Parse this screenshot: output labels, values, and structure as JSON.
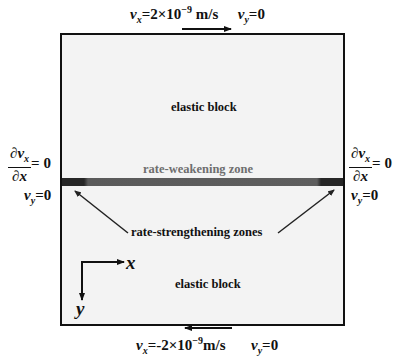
{
  "top_boundary": {
    "vx_label": "v",
    "vx_sub": "x",
    "vx_value": "=2×10",
    "vx_exp": "−9",
    "vx_unit": " m/s",
    "vy_label": "v",
    "vy_sub": "y",
    "vy_value": "=0",
    "arrow_direction": "right"
  },
  "bottom_boundary": {
    "vx_label": "v",
    "vx_sub": "x",
    "vx_value": "=-2×10",
    "vx_exp": "−9",
    "vx_unit": "m/s",
    "vy_label": "v",
    "vy_sub": "y",
    "vy_value": "=0",
    "arrow_direction": "left"
  },
  "left_boundary": {
    "deriv_num": "∂v",
    "deriv_num_sub": "x",
    "deriv_den": "∂x",
    "deriv_value": "= 0",
    "vy_label": "v",
    "vy_sub": "y",
    "vy_value": "=0"
  },
  "right_boundary": {
    "deriv_num": "∂v",
    "deriv_num_sub": "x",
    "deriv_den": "∂x",
    "deriv_value": "= 0",
    "vy_label": "v",
    "vy_sub": "y",
    "vy_value": "=0"
  },
  "regions": {
    "upper_block": "elastic block",
    "lower_block": "elastic block",
    "fault_zone": "rate-weakening zone",
    "edge_zones": "rate-strengthening zones"
  },
  "axes": {
    "x_label": "x",
    "y_label": "y"
  },
  "colors": {
    "block_fill": "#f3f3f3",
    "fault_center": "#5e5e5e",
    "fault_edges": "#262626",
    "zone_label": "#6e6e6e"
  }
}
